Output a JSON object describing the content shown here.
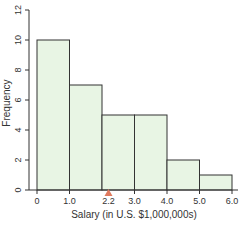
{
  "chart_data": {
    "type": "bar",
    "subtype": "histogram",
    "title": "",
    "xlabel": "Salary (in U.S. $1,000,000s)",
    "ylabel": "Frequency",
    "bins": [
      [
        0,
        1.0
      ],
      [
        1.0,
        2.0
      ],
      [
        2.0,
        3.0
      ],
      [
        3.0,
        4.0
      ],
      [
        4.0,
        5.0
      ],
      [
        5.0,
        6.0
      ]
    ],
    "categories": [
      "0-1.0",
      "1.0-2.0",
      "2.0-3.0",
      "3.0-4.0",
      "4.0-5.0",
      "5.0-6.0"
    ],
    "values": [
      10,
      7,
      5,
      5,
      2,
      1
    ],
    "xlim": [
      0,
      6.0
    ],
    "ylim": [
      0,
      12
    ],
    "xticks": [
      "0",
      "1.0",
      "2.2",
      "3.0",
      "4.0",
      "5.0",
      "6.0"
    ],
    "xtick_values": [
      0,
      1.0,
      2.2,
      3.0,
      4.0,
      5.0,
      6.0
    ],
    "yticks": [
      "0",
      "2",
      "4",
      "6",
      "8",
      "10",
      "12"
    ],
    "ytick_values": [
      0,
      2,
      4,
      6,
      8,
      10,
      12
    ],
    "grid": false,
    "annotations": [
      {
        "type": "triangle-marker",
        "x": 2.2,
        "label": "2.2",
        "color": "#e07a5f"
      }
    ],
    "colors": {
      "bar_fill": "#e8f5e4",
      "bar_edge": "#333333",
      "axis": "#333333",
      "marker": "#e07a5f"
    }
  }
}
